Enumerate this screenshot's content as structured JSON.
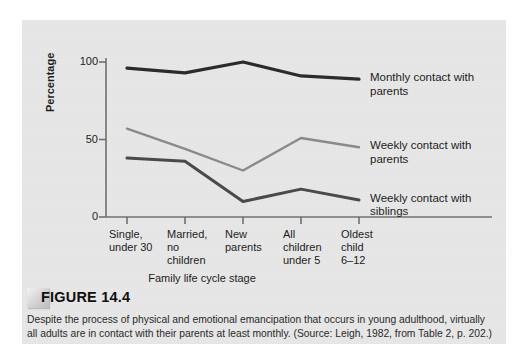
{
  "figure": {
    "title": "FIGURE 14.4",
    "caption": "Despite the process of physical and emotional emancipation that occurs in young adulthood, virtually all adults are in contact with their parents at least monthly. (Source: Leigh, 1982, from Table 2, p. 202.)"
  },
  "chart_data": {
    "type": "line",
    "title": "",
    "xlabel": "Family life cycle stage",
    "ylabel": "Percentage",
    "categories": [
      "Single,\nunder 30",
      "Married,\nno\nchildren",
      "New\nparents",
      "All\nchildren\nunder 5",
      "Oldest\nchild\n6–12"
    ],
    "ylim": [
      0,
      110
    ],
    "yticks": [
      0,
      50,
      100
    ],
    "ytick_labels": [
      "0",
      "50",
      "100"
    ],
    "grid": false,
    "legend_position": "right-of-line-ends",
    "series": [
      {
        "name": "Monthly contact with\nparents",
        "color": "#2b2b2b",
        "width": 3.2,
        "values": [
          96,
          93,
          100,
          91,
          89
        ]
      },
      {
        "name": "Weekly contact with\nparents",
        "color": "#8a8a8a",
        "width": 2.4,
        "values": [
          57,
          44,
          30,
          51,
          45
        ]
      },
      {
        "name": "Weekly contact with\nsiblings",
        "color": "#4a4a4a",
        "width": 3.0,
        "values": [
          38,
          36,
          10,
          18,
          11
        ]
      }
    ]
  },
  "colors": {
    "panel_background": "#e8e8e8",
    "page_background": "#ffffff",
    "axis": "#707070",
    "text": "#1d1d1d"
  }
}
